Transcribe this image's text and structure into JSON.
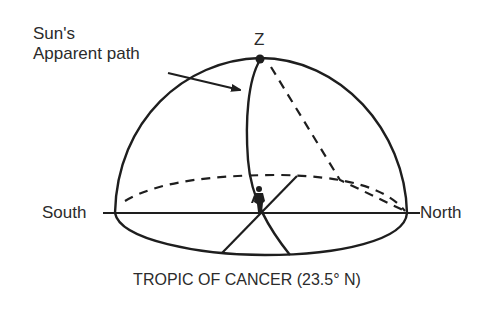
{
  "diagram": {
    "type": "celestial-sphere",
    "labels": {
      "sun_path_line1": "Sun's",
      "sun_path_line2": "Apparent path",
      "zenith": "Z",
      "south": "South",
      "north": "North"
    },
    "caption": "TROPIC OF CANCER (23.5° N)",
    "elements": [
      {
        "name": "celestial-dome",
        "style": "solid"
      },
      {
        "name": "horizon-line",
        "from": "South",
        "to": "North"
      },
      {
        "name": "horizon-ellipse-front",
        "style": "solid"
      },
      {
        "name": "horizon-ellipse-back",
        "style": "dashed"
      },
      {
        "name": "sun-apparent-path",
        "style": "solid",
        "passes_through": "Z"
      },
      {
        "name": "meridian-projection",
        "style": "dashed"
      },
      {
        "name": "east-west-line",
        "style": "solid"
      },
      {
        "name": "observer-figure"
      },
      {
        "name": "zenith-point"
      },
      {
        "name": "pointer-arrow",
        "target": "sun-apparent-path"
      }
    ],
    "colors": {
      "line": "#1e1e1e",
      "background": "#ffffff"
    }
  }
}
